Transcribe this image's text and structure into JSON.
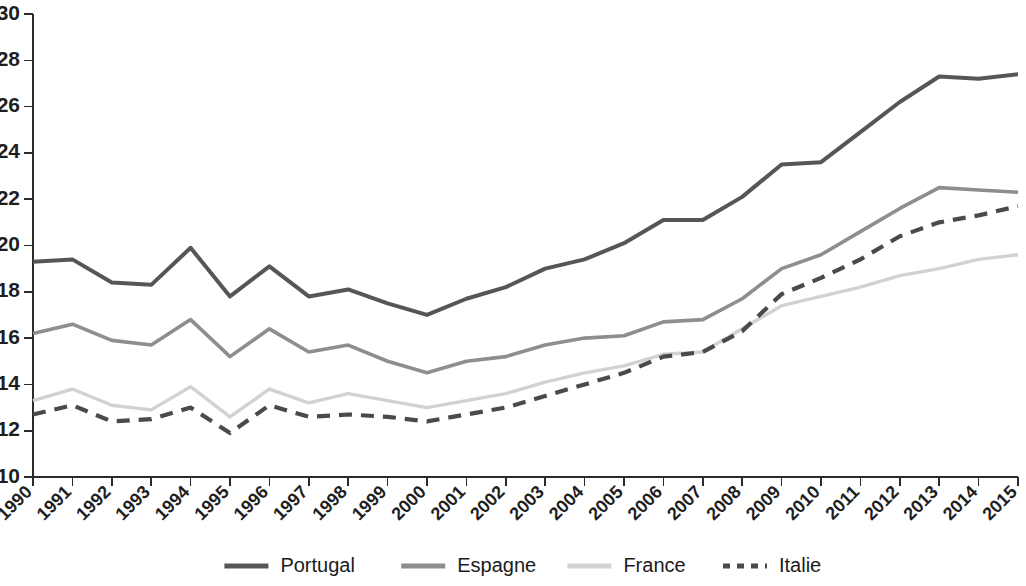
{
  "chart_data": {
    "type": "line",
    "title": "",
    "subtitle": "",
    "xlabel": "",
    "ylabel": "",
    "grid": false,
    "legend_position": "bottom",
    "xlim": [
      1990,
      2015
    ],
    "ylim": [
      10,
      30
    ],
    "ytick_step": 2,
    "ytick_labels": [
      "10",
      "12",
      "14",
      "16",
      "18",
      "20",
      "22",
      "24",
      "26",
      "28",
      "30"
    ],
    "ytick_values": [
      10,
      12,
      14,
      16,
      18,
      20,
      22,
      24,
      26,
      28,
      30
    ],
    "categories": [
      "1990",
      "1991",
      "1992",
      "1993",
      "1994",
      "1995",
      "1996",
      "1997",
      "1998",
      "1999",
      "2000",
      "2001",
      "2002",
      "2003",
      "2004",
      "2005",
      "2006",
      "2007",
      "2008",
      "2009",
      "2010",
      "2011",
      "2012",
      "2013",
      "2014",
      "2015"
    ],
    "x": [
      1990,
      1991,
      1992,
      1993,
      1994,
      1995,
      1996,
      1997,
      1998,
      1999,
      2000,
      2001,
      2002,
      2003,
      2004,
      2005,
      2006,
      2007,
      2008,
      2009,
      2010,
      2011,
      2012,
      2013,
      2014,
      2015
    ],
    "series": [
      {
        "name": "Portugal",
        "color": "#565656",
        "style": "solid",
        "width": 4.0,
        "values": [
          19.3,
          19.4,
          18.4,
          18.3,
          19.9,
          17.8,
          19.1,
          17.8,
          18.1,
          17.5,
          17.0,
          17.7,
          18.2,
          19.0,
          19.4,
          20.1,
          21.1,
          21.1,
          22.1,
          23.5,
          23.6,
          24.9,
          26.2,
          27.3,
          27.2,
          27.4
        ]
      },
      {
        "name": "Espagne",
        "color": "#8e8e8e",
        "style": "solid",
        "width": 3.6,
        "values": [
          16.2,
          16.6,
          15.9,
          15.7,
          16.8,
          15.2,
          16.4,
          15.4,
          15.7,
          15.0,
          14.5,
          15.0,
          15.2,
          15.7,
          16.0,
          16.1,
          16.7,
          16.8,
          17.7,
          19.0,
          19.6,
          20.6,
          21.6,
          22.5,
          22.4,
          22.3
        ]
      },
      {
        "name": "France",
        "color": "#d2d2d2",
        "style": "solid",
        "width": 3.4,
        "values": [
          13.3,
          13.8,
          13.1,
          12.9,
          13.9,
          12.6,
          13.8,
          13.2,
          13.6,
          13.3,
          13.0,
          13.3,
          13.6,
          14.1,
          14.5,
          14.8,
          15.3,
          15.4,
          16.4,
          17.4,
          17.8,
          18.2,
          18.7,
          19.0,
          19.4,
          19.6
        ]
      },
      {
        "name": "Italie",
        "color": "#4a4a4a",
        "style": "dashed",
        "width": 4.2,
        "dash": "13,9",
        "values": [
          12.7,
          13.1,
          12.4,
          12.5,
          13.0,
          11.9,
          13.1,
          12.6,
          12.7,
          12.6,
          12.4,
          12.7,
          13.0,
          13.5,
          14.0,
          14.5,
          15.2,
          15.4,
          16.3,
          17.9,
          18.6,
          19.4,
          20.4,
          21.0,
          21.3,
          21.7
        ]
      }
    ],
    "legend": [
      {
        "label": "Portugal",
        "color": "#565656",
        "style": "solid"
      },
      {
        "label": "Espagne",
        "color": "#8e8e8e",
        "style": "solid"
      },
      {
        "label": "France",
        "color": "#d2d2d2",
        "style": "solid"
      },
      {
        "label": "Italie",
        "color": "#4a4a4a",
        "style": "dashed"
      }
    ]
  }
}
